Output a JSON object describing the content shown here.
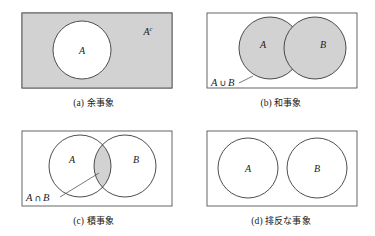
{
  "figure": {
    "background_color": "#ffffff",
    "shade_color": "#d2d2d2",
    "stroke_color": "#555555",
    "text_color": "#1a1a1a",
    "panels": [
      {
        "id": "a",
        "caption_marker": "(a)",
        "caption_text": "余事象",
        "caption_full": "(a) 余事象",
        "diagram_type": "venn-complement",
        "shaded_region": "outside-A",
        "labels": {
          "circle_a": "A",
          "complement": "A",
          "complement_superscript": "c"
        }
      },
      {
        "id": "b",
        "caption_marker": "(b)",
        "caption_text": "和事象",
        "caption_full": "(b) 和事象",
        "diagram_type": "venn-union",
        "shaded_region": "A-union-B",
        "labels": {
          "circle_a": "A",
          "circle_b": "B",
          "expr_left": "A",
          "expr_op": "∪",
          "expr_right": "B",
          "expr_full": "A ∪ B"
        }
      },
      {
        "id": "c",
        "caption_marker": "(c)",
        "caption_text": "積事象",
        "caption_full": "(c) 積事象",
        "diagram_type": "venn-intersection",
        "shaded_region": "A-intersect-B",
        "labels": {
          "circle_a": "A",
          "circle_b": "B",
          "expr_left": "A",
          "expr_op": "∩",
          "expr_right": "B",
          "expr_full": "A ∩ B"
        }
      },
      {
        "id": "d",
        "caption_marker": "(d)",
        "caption_text": "排反な事象",
        "caption_full": "(d) 排反な事象",
        "diagram_type": "venn-disjoint",
        "shaded_region": "none",
        "labels": {
          "circle_a": "A",
          "circle_b": "B"
        }
      }
    ]
  }
}
